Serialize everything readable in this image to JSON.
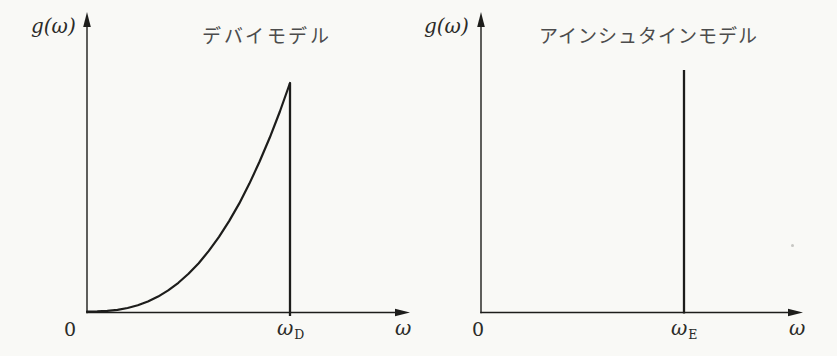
{
  "figure": {
    "description_colors": {
      "ink": "#1d1d1b",
      "math_label": "#2b2b28",
      "title_gray": "#4c4c4c",
      "paper": "#f9f9f6"
    }
  },
  "chart_data": [
    {
      "type": "line",
      "title": "デバイモデル",
      "ylabel": "g(ω)",
      "xlabel": "ω",
      "origin_label": "0",
      "cutoff_label": {
        "base": "ω",
        "sub": "D"
      },
      "x_ticks": [
        "0",
        "ωD"
      ],
      "axis_arrows": true,
      "grid": false,
      "xlim_norm": [
        0,
        1.55
      ],
      "ylim_norm": [
        0,
        1.1
      ],
      "series": [
        {
          "name": "debye-density-of-states",
          "shape": "g(ω) ∝ ω^p rising to cutoff ωD then dropping vertically to 0",
          "x_unit": "ω/ωD",
          "points": [
            [
              0.0,
              0.0
            ],
            [
              0.05,
              0.0004
            ],
            [
              0.1,
              0.0025
            ],
            [
              0.15,
              0.0072
            ],
            [
              0.2,
              0.0152
            ],
            [
              0.25,
              0.0272
            ],
            [
              0.3,
              0.0437
            ],
            [
              0.35,
              0.0653
            ],
            [
              0.4,
              0.0923
            ],
            [
              0.45,
              0.1255
            ],
            [
              0.5,
              0.165
            ],
            [
              0.55,
              0.2113
            ],
            [
              0.6,
              0.265
            ],
            [
              0.65,
              0.3264
            ],
            [
              0.7,
              0.3955
            ],
            [
              0.75,
              0.4732
            ],
            [
              0.8,
              0.5598
            ],
            [
              0.85,
              0.6554
            ],
            [
              0.9,
              0.7603
            ],
            [
              0.95,
              0.8752
            ],
            [
              1.0,
              1.0
            ]
          ],
          "cutoff_norm": 1.0
        }
      ]
    },
    {
      "type": "line",
      "title": "アインシュタインモデル",
      "ylabel": "g(ω)",
      "xlabel": "ω",
      "origin_label": "0",
      "cutoff_label": {
        "base": "ω",
        "sub": "E"
      },
      "x_ticks": [
        "0",
        "ωE"
      ],
      "axis_arrows": true,
      "grid": false,
      "xlim_norm": [
        0,
        1.55
      ],
      "ylim_norm": [
        0,
        1.1
      ],
      "series": [
        {
          "name": "einstein-delta-function",
          "shape": "single delta-function spike at ω = ωE",
          "x_unit": "ω/ωE",
          "points": [
            [
              1.0,
              0.0
            ],
            [
              1.0,
              1.0
            ]
          ],
          "cutoff_norm": 1.0
        }
      ]
    }
  ]
}
